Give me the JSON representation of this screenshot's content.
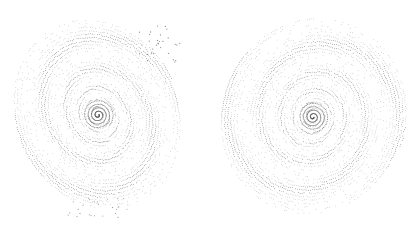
{
  "figure": {
    "width": 410,
    "height": 230,
    "background": "#ffffff",
    "dot_color": "#555555",
    "galaxies": [
      {
        "name": "left-spiral",
        "cx": 98,
        "cy": 115,
        "rx": 82,
        "ry": 98,
        "rotation_deg": -25,
        "turns": 4.2,
        "arms": 2,
        "rings": 26,
        "stray_dots": true
      },
      {
        "name": "right-spiral",
        "cx": 313,
        "cy": 117,
        "rx": 92,
        "ry": 100,
        "rotation_deg": 20,
        "turns": 4.4,
        "arms": 2,
        "rings": 28,
        "stray_dots": false
      }
    ]
  }
}
